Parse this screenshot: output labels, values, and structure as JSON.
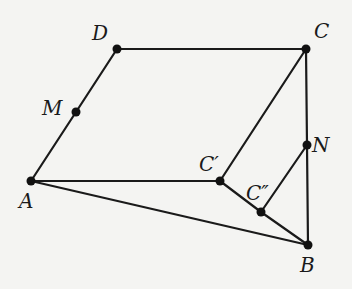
{
  "diagram": {
    "type": "geometry-figure",
    "background": "#f4f4f2",
    "stroke_color": "#1a1a1a",
    "points": [
      {
        "id": "D",
        "label": "D",
        "x": 117,
        "y": 49,
        "lx": 92,
        "ly": 40
      },
      {
        "id": "C",
        "label": "C",
        "x": 306,
        "y": 49,
        "lx": 314,
        "ly": 38
      },
      {
        "id": "M",
        "label": "M",
        "x": 76,
        "y": 112,
        "lx": 42,
        "ly": 115
      },
      {
        "id": "A",
        "label": "A",
        "x": 31,
        "y": 181,
        "lx": 19,
        "ly": 208
      },
      {
        "id": "C1",
        "label": "C′",
        "x": 220,
        "y": 181,
        "lx": 199,
        "ly": 171
      },
      {
        "id": "N",
        "label": "N",
        "x": 307,
        "y": 145,
        "lx": 312,
        "ly": 152
      },
      {
        "id": "C2",
        "label": "C″",
        "x": 261,
        "y": 212,
        "lx": 246,
        "ly": 200
      },
      {
        "id": "B",
        "label": "B",
        "x": 308,
        "y": 245,
        "lx": 300,
        "ly": 272
      }
    ],
    "segments": [
      [
        "D",
        "C"
      ],
      [
        "D",
        "M"
      ],
      [
        "M",
        "A"
      ],
      [
        "A",
        "C1"
      ],
      [
        "A",
        "B"
      ],
      [
        "C",
        "C1"
      ],
      [
        "C",
        "N"
      ],
      [
        "N",
        "B"
      ],
      [
        "C1",
        "C2"
      ],
      [
        "C2",
        "B"
      ],
      [
        "N",
        "C2"
      ]
    ]
  }
}
